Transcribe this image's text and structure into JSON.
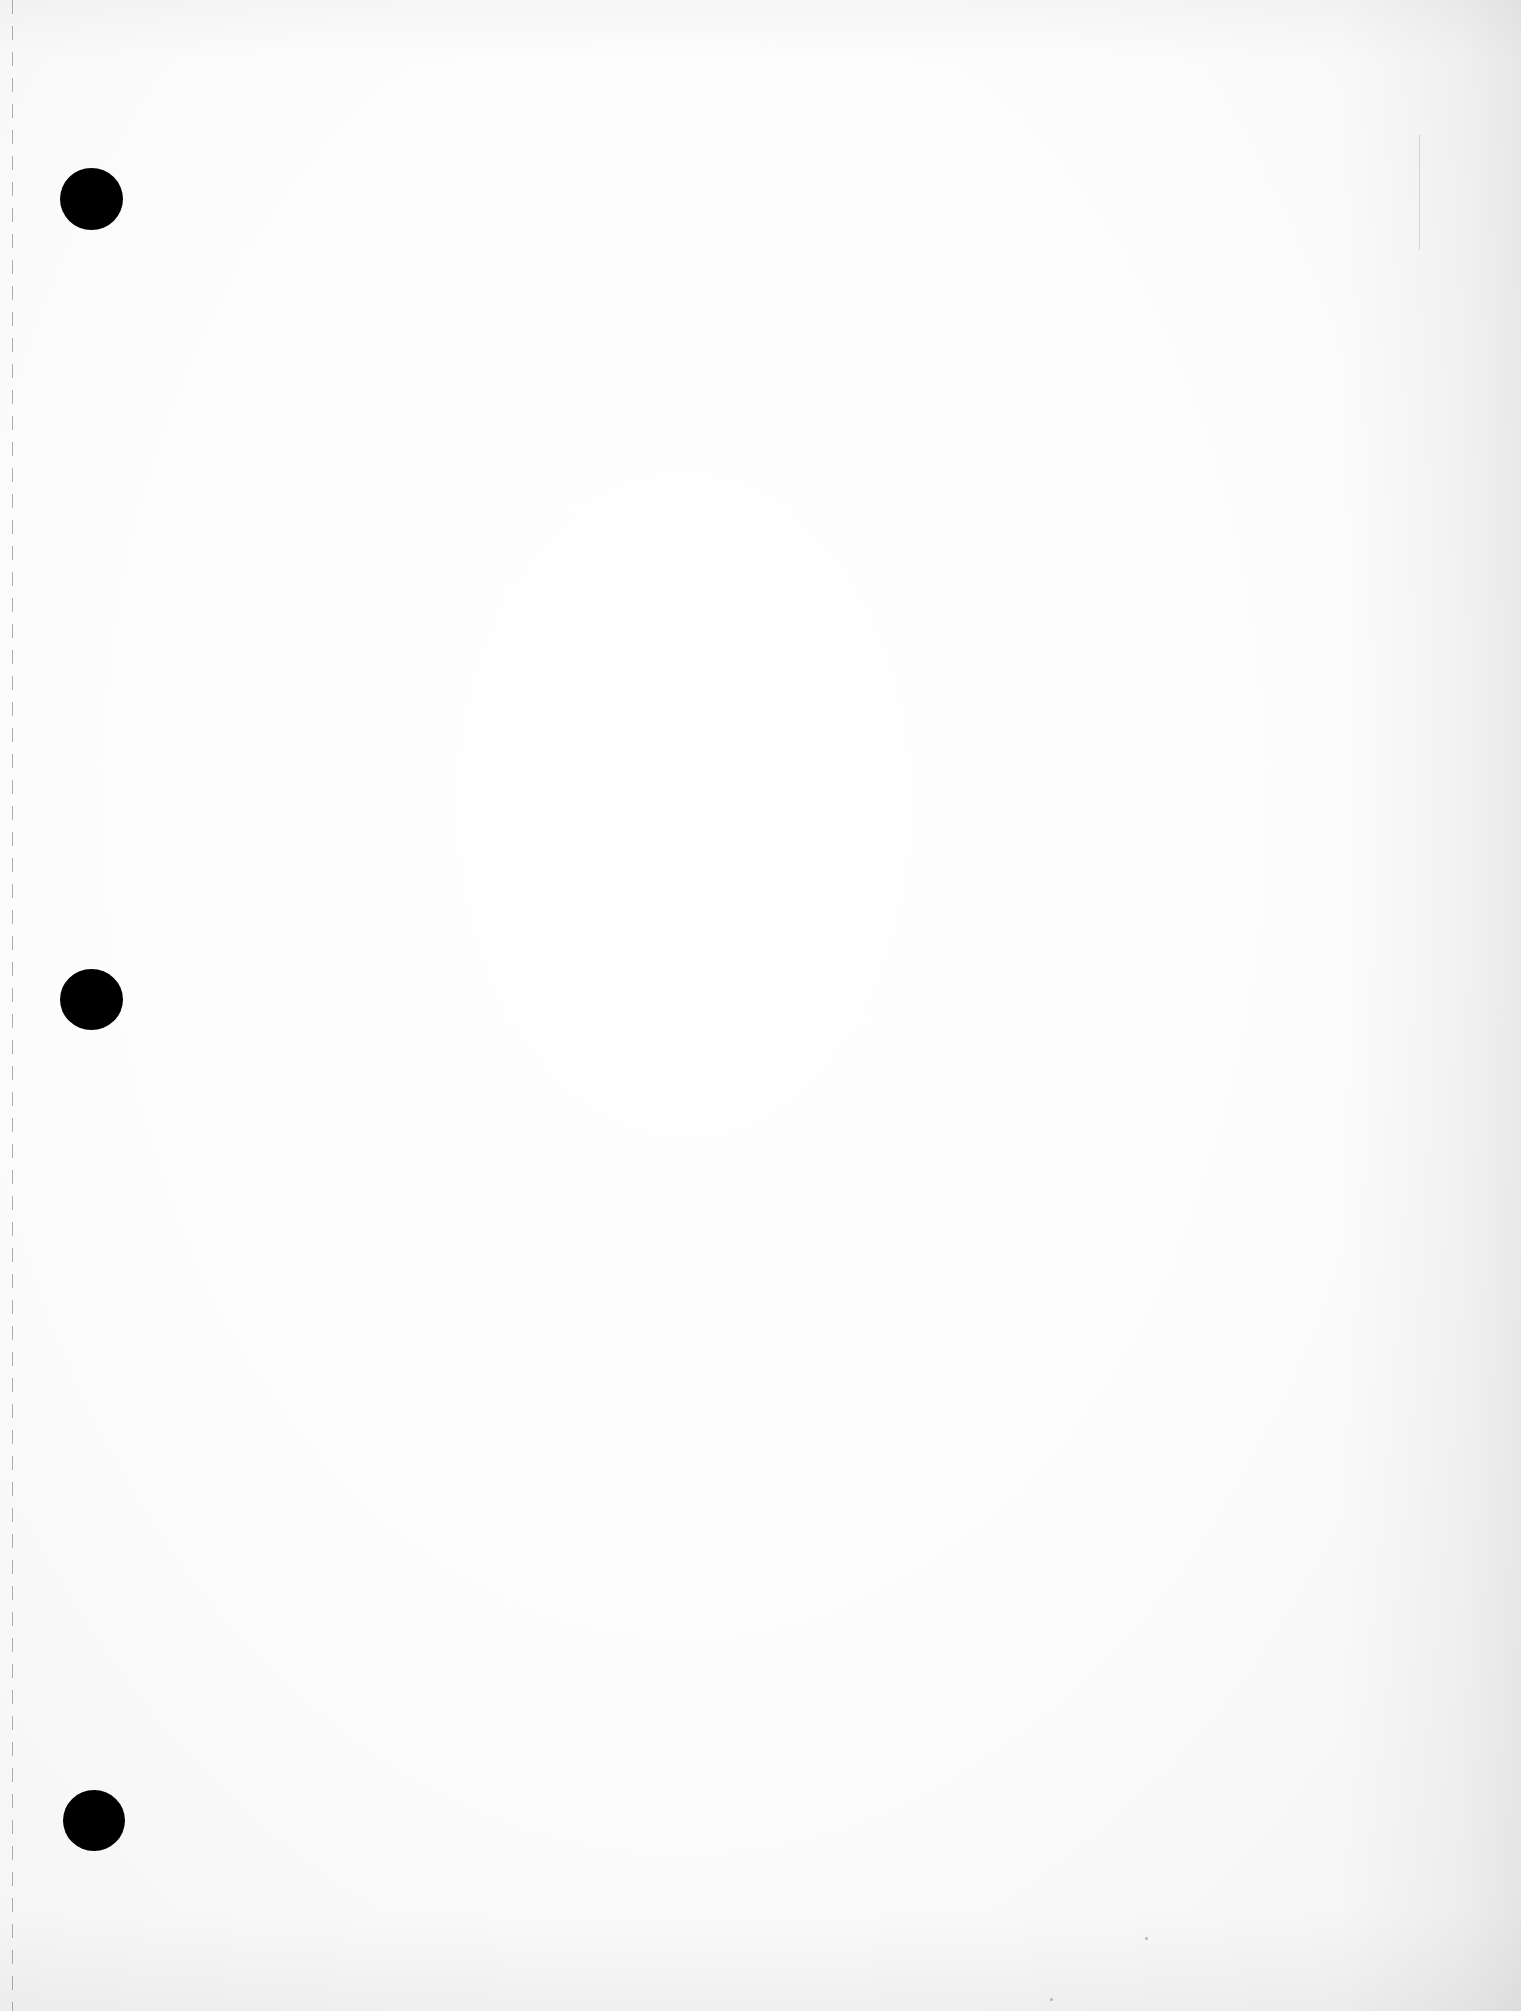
{
  "document": {
    "type": "blank three-hole-punched sheet",
    "text_content": "",
    "hole_count": 3,
    "colors": {
      "paper": "#fcfcfc",
      "holes": "#000000",
      "perforation": "#6e6e6e"
    }
  }
}
